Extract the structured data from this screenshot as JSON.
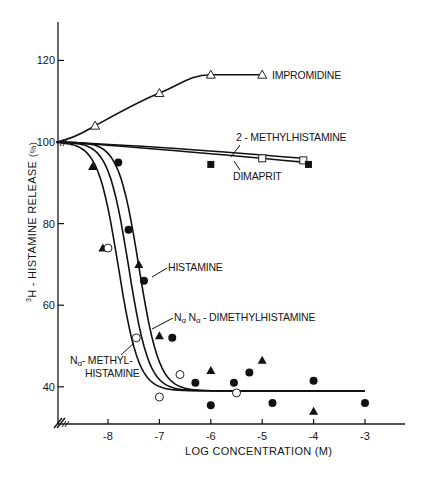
{
  "chart_data": {
    "type": "line",
    "title": "",
    "xlabel": "LOG CONCENTRATION (M)",
    "ylabel": "³H - HISTAMINE RELEASE (%)",
    "ylabel_parts": {
      "sup": "3",
      "main": "H - HISTAMINE  RELEASE",
      "unit": "(%)"
    },
    "xlim": [
      -9,
      -2.3
    ],
    "ylim": [
      31,
      130
    ],
    "x_ticks": [
      -8,
      -7,
      -6,
      -5,
      -4,
      -3
    ],
    "x_tick_labels": [
      "-8",
      "-7",
      "-6",
      "-5",
      "-4",
      "-3"
    ],
    "y_ticks": [
      40,
      60,
      80,
      100,
      120
    ],
    "y_tick_labels": [
      "40",
      "60",
      "80",
      "100",
      "120"
    ],
    "grid": false,
    "legend": "inline labels with leader arrows",
    "axis_break": "//",
    "series": [
      {
        "name": "IMPROMIDINE",
        "marker": "open-triangle",
        "points": [
          [
            -9,
            100
          ],
          [
            -8.25,
            104
          ],
          [
            -7,
            112
          ],
          [
            -6,
            116.5
          ],
          [
            -5,
            116.5
          ]
        ]
      },
      {
        "name": "2-METHYLHISTAMINE",
        "marker": "open-square",
        "points": [
          [
            -9,
            100
          ],
          [
            -5,
            96
          ],
          [
            -4.2,
            95.5
          ]
        ]
      },
      {
        "name": "DIMAPRIT",
        "marker": "filled-square",
        "points": [
          [
            -9,
            100
          ],
          [
            -6,
            94.5
          ],
          [
            -4.1,
            94.5
          ]
        ]
      },
      {
        "name": "HISTAMINE",
        "marker": "filled-circle",
        "curve_ec50_log": -7.4,
        "points": [
          [
            -7.8,
            95
          ],
          [
            -7.6,
            78.5
          ],
          [
            -7.3,
            66
          ],
          [
            -6.75,
            52
          ],
          [
            -6.3,
            41
          ],
          [
            -6,
            35.5
          ],
          [
            -5.55,
            41
          ],
          [
            -5.25,
            43.5
          ],
          [
            -4.8,
            36
          ],
          [
            -4,
            41.5
          ],
          [
            -3,
            36
          ]
        ]
      },
      {
        "name": "Nα,Nα-DIMETHYLHISTAMINE",
        "marker": "filled-triangle",
        "curve_ec50_log": -7.6,
        "points": [
          [
            -8.3,
            94
          ],
          [
            -8.1,
            74
          ],
          [
            -7.4,
            70
          ],
          [
            -7,
            52.5
          ],
          [
            -6,
            44
          ],
          [
            -5,
            46.5
          ],
          [
            -4,
            34
          ]
        ]
      },
      {
        "name": "Nα-METHYLHISTAMINE",
        "marker": "open-circle",
        "curve_ec50_log": -7.8,
        "points": [
          [
            -8,
            74
          ],
          [
            -7.45,
            52
          ],
          [
            -7,
            37.5
          ],
          [
            -6.6,
            43
          ],
          [
            -5.5,
            38.5
          ]
        ]
      }
    ],
    "plateau": {
      "start": 100,
      "bottom": 39,
      "x_end": -3
    }
  },
  "labels": {
    "impromidine": "IMPROMIDINE",
    "methylhistamine2": "2 - METHYLHISTAMINE",
    "dimaprit": "DIMAPRIT",
    "histamine": "HISTAMINE",
    "dimethyl_prefix_1": "N",
    "dimethyl_sub_1": "α",
    "dimethyl_sep": " N",
    "dimethyl_sub_2": "α",
    "dimethyl_rest": " - DIMETHYLHISTAMINE",
    "methyl_n": "N",
    "methyl_sub": "α",
    "methyl_rest": "- METHYL-",
    "methyl_line2": "HISTAMINE"
  }
}
